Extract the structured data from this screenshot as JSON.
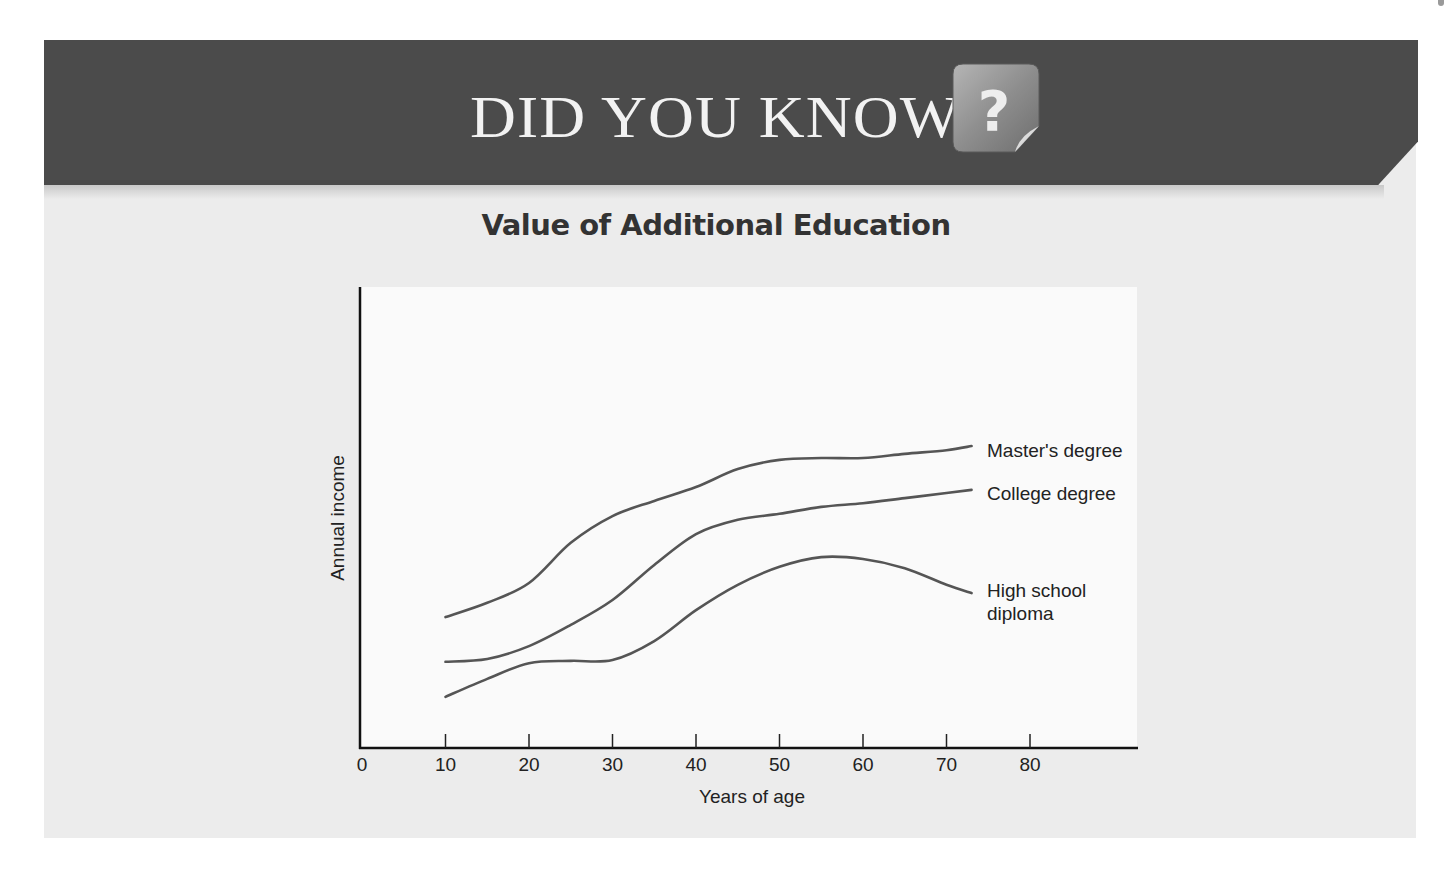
{
  "banner": {
    "title": "DID YOU KNOW",
    "icon": "question-mark-icon",
    "colors": {
      "banner": "#4b4b4b",
      "panel": "#ececec",
      "plot": "#fafafa",
      "line": "#555555"
    }
  },
  "chart_data": {
    "type": "line",
    "title": "Value of Additional Education",
    "xlabel": "Years of age",
    "ylabel": "Annual income",
    "xlim": [
      0,
      93
    ],
    "ylim": [
      0,
      100
    ],
    "x_ticks": [
      0,
      10,
      20,
      30,
      40,
      50,
      60,
      70,
      80
    ],
    "x_tick_labels": [
      "0",
      "10",
      "20",
      "30",
      "40",
      "50",
      "60",
      "70",
      "80"
    ],
    "y_ticks": [],
    "grid": false,
    "legend": "inline labels at right end of each line",
    "y_units_note": "No numeric y-axis; values are relative (0 = x-axis, 100 = top of plot)",
    "x": [
      10,
      15,
      20,
      25,
      30,
      35,
      40,
      45,
      50,
      55,
      60,
      65,
      70,
      73
    ],
    "series": [
      {
        "name": "Master's degree",
        "label": "Master's degree",
        "values": [
          28.4,
          31.5,
          35.8,
          44.5,
          50.3,
          53.6,
          56.6,
          60.5,
          62.5,
          62.9,
          62.9,
          63.8,
          64.6,
          65.5
        ]
      },
      {
        "name": "College degree",
        "label": "College degree",
        "values": [
          18.7,
          19.3,
          22.1,
          26.7,
          32.1,
          39.7,
          46.4,
          49.5,
          50.8,
          52.3,
          53.1,
          54.2,
          55.3,
          56.0
        ]
      },
      {
        "name": "High school diploma",
        "label_lines": [
          "High school",
          "diploma"
        ],
        "values": [
          11.1,
          15.0,
          18.4,
          18.9,
          19.1,
          23.2,
          29.9,
          35.4,
          39.3,
          41.4,
          41.0,
          39.0,
          35.4,
          33.6
        ]
      }
    ]
  }
}
